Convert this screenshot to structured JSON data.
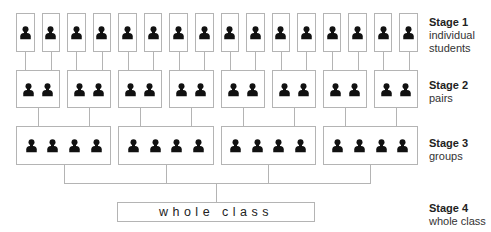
{
  "stages": [
    {
      "title": "Stage 1",
      "subtitle_lines": [
        "individual",
        "students"
      ],
      "box_count": 16,
      "people_per_box": 1
    },
    {
      "title": "Stage 2",
      "subtitle_lines": [
        "pairs"
      ],
      "box_count": 8,
      "people_per_box": 2
    },
    {
      "title": "Stage 3",
      "subtitle_lines": [
        "groups"
      ],
      "box_count": 4,
      "people_per_box": 4
    },
    {
      "title": "Stage 4",
      "subtitle_lines": [
        "whole class"
      ],
      "box_count": 1,
      "people_per_box": 0
    }
  ],
  "whole_class_box": {
    "label": "whole class"
  },
  "colors": {
    "line": "#b4b4b4",
    "icon": "#111111",
    "text": "#333333"
  }
}
